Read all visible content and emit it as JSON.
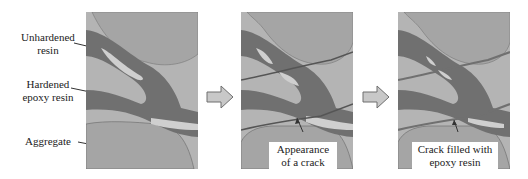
{
  "labels": {
    "unhardened_resin": [
      "Unhardened",
      "resin"
    ],
    "hardened_epoxy": [
      "Hardened",
      "epoxy resin"
    ],
    "aggregate": "Aggregate"
  },
  "panels": [
    {
      "id": "initial",
      "callout": null
    },
    {
      "id": "crack",
      "callout": [
        "Appearance",
        "of a crack"
      ]
    },
    {
      "id": "filled",
      "callout": [
        "Crack filled with",
        "epoxy resin"
      ]
    }
  ],
  "colors": {
    "matrix": "#b4b4b4",
    "aggregate": "#a5a5a5",
    "hardened_resin": "#707070",
    "unhardened_resin": "#cfcfcf",
    "arrow_fill": "#c8c8c8",
    "arrow_stroke": "#6e6e6e"
  }
}
